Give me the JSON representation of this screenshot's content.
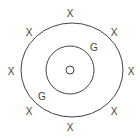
{
  "diagram": {
    "outer_ring": {
      "cx": 72,
      "cy": 70,
      "rx": 51,
      "ry": 47
    },
    "inner_ring": {
      "cx": 70,
      "cy": 70,
      "r": 24
    },
    "center_mark": {
      "label": "center-circle",
      "cx": 70,
      "cy": 70,
      "r": 4
    },
    "outer_markers": [
      {
        "label": "X",
        "x": 70,
        "y": 17
      },
      {
        "label": "X",
        "x": 29,
        "y": 36
      },
      {
        "label": "X",
        "x": 114,
        "y": 36
      },
      {
        "label": "X",
        "x": 11,
        "y": 75
      },
      {
        "label": "X",
        "x": 131,
        "y": 75
      },
      {
        "label": "X",
        "x": 29,
        "y": 115
      },
      {
        "label": "X",
        "x": 114,
        "y": 115
      },
      {
        "label": "X",
        "x": 70,
        "y": 131
      }
    ],
    "inner_markers": [
      {
        "label": "G",
        "x": 94,
        "y": 51
      },
      {
        "label": "G",
        "x": 42,
        "y": 100
      }
    ],
    "colors": {
      "stroke": "#444444",
      "background": "#ffffff"
    }
  }
}
